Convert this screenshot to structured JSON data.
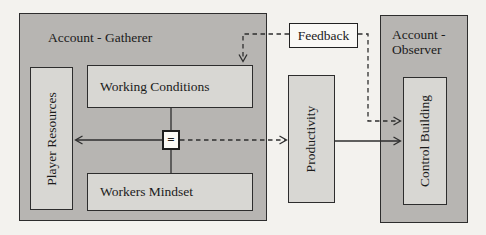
{
  "diagram": {
    "colors": {
      "background": "#f3f2ee",
      "group_fill": "#b7b5b2",
      "node_fill": "#d8d7d3",
      "white_node_fill": "#faf9f6",
      "line": "#2e2e2e",
      "text": "#1b1b1b"
    },
    "groups": {
      "gatherer": {
        "label": "Account - Gatherer"
      },
      "observer": {
        "label": "Account - Observer"
      }
    },
    "nodes": {
      "player_resources": {
        "label": "Player Resources",
        "orientation": "vertical"
      },
      "working_conditions": {
        "label": "Working Conditions",
        "orientation": "horizontal"
      },
      "workers_mindset": {
        "label": "Workers Mindset",
        "orientation": "horizontal"
      },
      "equals": {
        "label": "=",
        "orientation": "horizontal"
      },
      "feedback": {
        "label": "Feedback",
        "orientation": "horizontal"
      },
      "productivity": {
        "label": "Productivity",
        "orientation": "vertical"
      },
      "control_building": {
        "label": "Control Building",
        "orientation": "vertical"
      }
    },
    "edges": [
      {
        "name": "working-conditions-to-equals",
        "from": "working_conditions",
        "to": "equals",
        "style": "solid",
        "arrow": false
      },
      {
        "name": "equals-to-workers-mindset",
        "from": "equals",
        "to": "workers_mindset",
        "style": "solid",
        "arrow": false
      },
      {
        "name": "equals-to-player-resources",
        "from": "equals",
        "to": "player_resources",
        "style": "solid",
        "arrow": true
      },
      {
        "name": "equals-to-productivity",
        "from": "equals",
        "to": "productivity",
        "style": "dashed",
        "arrow": true
      },
      {
        "name": "productivity-to-control-building",
        "from": "productivity",
        "to": "control_building",
        "style": "solid",
        "arrow": true
      },
      {
        "name": "feedback-to-working-conditions",
        "from": "feedback",
        "to": "working_conditions",
        "style": "dashed",
        "arrow": true
      },
      {
        "name": "feedback-to-control-building",
        "from": "feedback",
        "to": "control_building",
        "style": "dashed",
        "arrow": true
      }
    ]
  }
}
